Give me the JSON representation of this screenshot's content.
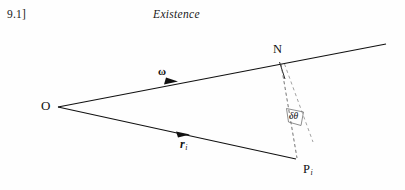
{
  "page": {
    "width": 405,
    "height": 190,
    "background_color": "#fefefe",
    "ink_color": "#111111"
  },
  "running_head": {
    "section_number": "9.1]",
    "chapter_title": "Existence"
  },
  "figure": {
    "type": "geometry-diagram",
    "points": [
      {
        "name": "O",
        "label": "O",
        "x": 58,
        "y": 107
      },
      {
        "name": "N",
        "label": "N",
        "x": 281,
        "y": 62
      },
      {
        "name": "P_i",
        "label": "P",
        "subscript": "i",
        "x": 296,
        "y": 159
      }
    ],
    "vectors": [
      {
        "name": "omega",
        "label": "ω",
        "label_x": 158,
        "label_y": 66,
        "from": [
          58,
          107
        ],
        "to": [
          386,
          44
        ],
        "arrow_at": [
          170,
          82
        ],
        "style": "solid",
        "bold_label": true
      },
      {
        "name": "r_i",
        "label": "r",
        "subscript": "i",
        "label_x": 180,
        "label_y": 138,
        "from": [
          58,
          107
        ],
        "to": [
          296,
          159
        ],
        "arrow_at": [
          183,
          134
        ],
        "style": "solid",
        "bold_label": true
      }
    ],
    "construction_lines": [
      {
        "name": "N-to-P",
        "from": [
          281,
          63
        ],
        "to": [
          297,
          158
        ],
        "style": "dashed"
      },
      {
        "name": "N-to-displaced",
        "from": [
          284,
          63
        ],
        "to": [
          312,
          142
        ],
        "style": "dashed"
      },
      {
        "name": "perpendicular-tick",
        "from": [
          279,
          62
        ],
        "to": [
          285,
          78
        ],
        "style": "solid"
      }
    ],
    "angle": {
      "name": "delta-theta",
      "label": "δθ",
      "label_x": 289,
      "label_y": 112,
      "vertex": "N",
      "between": [
        "N-to-P",
        "N-to-displaced"
      ]
    }
  }
}
